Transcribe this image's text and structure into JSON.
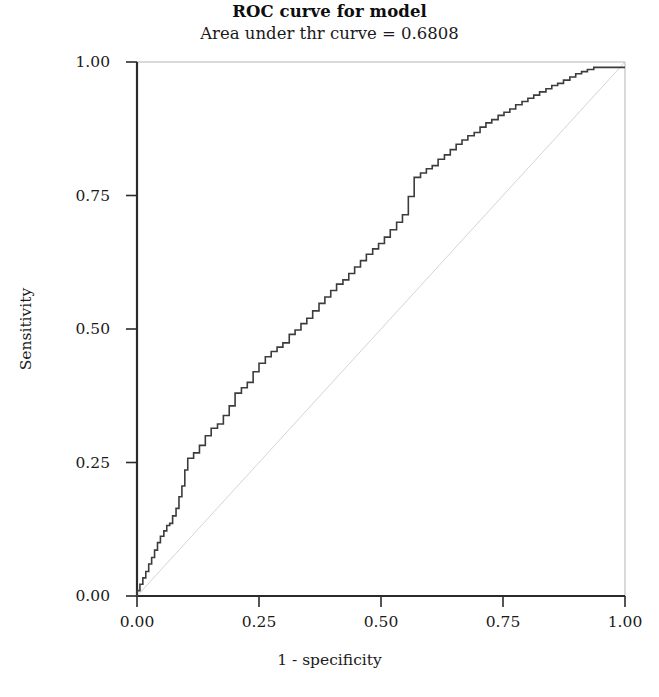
{
  "chart_data": {
    "type": "line",
    "title": "ROC curve for model",
    "subtitle": "Area under thr curve = 0.6808",
    "auc": 0.6808,
    "xlabel": "1 - specificity",
    "ylabel": "Sensitivity",
    "xlim": [
      0,
      1
    ],
    "ylim": [
      0,
      1
    ],
    "grid": false,
    "legend": null,
    "xticks": [
      "0.00",
      "0.25",
      "0.50",
      "0.75",
      "1.00"
    ],
    "xtick_values": [
      0,
      0.25,
      0.5,
      0.75,
      1
    ],
    "yticks": [
      "0.00",
      "0.25",
      "0.50",
      "0.75",
      "1.00"
    ],
    "ytick_values": [
      0,
      0.25,
      0.5,
      0.75,
      1
    ],
    "series": [
      {
        "name": "ROC curve",
        "style": "step",
        "color": "#3c3c3c",
        "width": 1.6,
        "x": [
          0.0,
          0.0,
          0.006,
          0.006,
          0.012,
          0.012,
          0.018,
          0.018,
          0.024,
          0.024,
          0.03,
          0.03,
          0.036,
          0.036,
          0.042,
          0.042,
          0.048,
          0.048,
          0.055,
          0.055,
          0.061,
          0.061,
          0.067,
          0.067,
          0.073,
          0.073,
          0.08,
          0.08,
          0.086,
          0.086,
          0.092,
          0.092,
          0.098,
          0.098,
          0.104,
          0.104,
          0.116,
          0.116,
          0.128,
          0.128,
          0.14,
          0.14,
          0.152,
          0.152,
          0.165,
          0.165,
          0.177,
          0.177,
          0.189,
          0.189,
          0.201,
          0.201,
          0.214,
          0.214,
          0.226,
          0.226,
          0.238,
          0.238,
          0.25,
          0.25,
          0.263,
          0.263,
          0.275,
          0.275,
          0.287,
          0.287,
          0.299,
          0.299,
          0.312,
          0.312,
          0.324,
          0.324,
          0.336,
          0.336,
          0.348,
          0.348,
          0.36,
          0.36,
          0.373,
          0.373,
          0.385,
          0.385,
          0.397,
          0.397,
          0.409,
          0.409,
          0.422,
          0.422,
          0.434,
          0.434,
          0.446,
          0.446,
          0.458,
          0.458,
          0.47,
          0.47,
          0.483,
          0.483,
          0.495,
          0.495,
          0.507,
          0.507,
          0.519,
          0.519,
          0.532,
          0.532,
          0.544,
          0.544,
          0.556,
          0.556,
          0.568,
          0.568,
          0.581,
          0.581,
          0.593,
          0.593,
          0.605,
          0.605,
          0.617,
          0.617,
          0.63,
          0.63,
          0.642,
          0.642,
          0.654,
          0.654,
          0.666,
          0.666,
          0.678,
          0.678,
          0.691,
          0.691,
          0.703,
          0.703,
          0.715,
          0.715,
          0.727,
          0.727,
          0.74,
          0.74,
          0.752,
          0.752,
          0.764,
          0.764,
          0.776,
          0.776,
          0.789,
          0.789,
          0.801,
          0.801,
          0.813,
          0.813,
          0.825,
          0.825,
          0.838,
          0.838,
          0.85,
          0.85,
          0.862,
          0.862,
          0.874,
          0.874,
          0.887,
          0.887,
          0.899,
          0.899,
          0.911,
          0.911,
          0.923,
          0.923,
          0.936,
          0.936,
          0.948,
          0.948,
          0.96,
          1.0,
          1.0
        ],
        "y": [
          0.0,
          0.01,
          0.01,
          0.022,
          0.022,
          0.034,
          0.034,
          0.046,
          0.046,
          0.06,
          0.06,
          0.072,
          0.072,
          0.086,
          0.086,
          0.1,
          0.1,
          0.112,
          0.112,
          0.122,
          0.122,
          0.132,
          0.132,
          0.136,
          0.136,
          0.15,
          0.15,
          0.164,
          0.164,
          0.186,
          0.186,
          0.206,
          0.206,
          0.236,
          0.236,
          0.258,
          0.258,
          0.268,
          0.268,
          0.282,
          0.282,
          0.3,
          0.3,
          0.314,
          0.314,
          0.322,
          0.322,
          0.338,
          0.338,
          0.356,
          0.356,
          0.38,
          0.38,
          0.39,
          0.39,
          0.4,
          0.4,
          0.42,
          0.42,
          0.436,
          0.436,
          0.448,
          0.448,
          0.458,
          0.458,
          0.466,
          0.466,
          0.474,
          0.474,
          0.49,
          0.49,
          0.498,
          0.498,
          0.51,
          0.51,
          0.52,
          0.52,
          0.534,
          0.534,
          0.548,
          0.548,
          0.56,
          0.56,
          0.572,
          0.572,
          0.584,
          0.584,
          0.592,
          0.592,
          0.604,
          0.604,
          0.616,
          0.616,
          0.628,
          0.628,
          0.64,
          0.64,
          0.65,
          0.65,
          0.66,
          0.66,
          0.672,
          0.672,
          0.686,
          0.686,
          0.7,
          0.7,
          0.714,
          0.714,
          0.748,
          0.748,
          0.784,
          0.784,
          0.792,
          0.792,
          0.8,
          0.8,
          0.806,
          0.806,
          0.818,
          0.818,
          0.826,
          0.826,
          0.836,
          0.836,
          0.846,
          0.846,
          0.854,
          0.854,
          0.862,
          0.862,
          0.868,
          0.868,
          0.878,
          0.878,
          0.886,
          0.886,
          0.892,
          0.892,
          0.9,
          0.9,
          0.906,
          0.906,
          0.912,
          0.912,
          0.92,
          0.92,
          0.926,
          0.926,
          0.932,
          0.932,
          0.938,
          0.938,
          0.944,
          0.944,
          0.95,
          0.95,
          0.956,
          0.956,
          0.96,
          0.96,
          0.966,
          0.966,
          0.972,
          0.972,
          0.978,
          0.978,
          0.982,
          0.982,
          0.986,
          0.986,
          0.99,
          0.99,
          0.99,
          0.99,
          0.99,
          0.99
        ]
      },
      {
        "name": "reference diagonal",
        "style": "line",
        "color": "#c9c9c9",
        "width": 0.8,
        "x": [
          0,
          1
        ],
        "y": [
          0,
          1
        ]
      }
    ]
  }
}
